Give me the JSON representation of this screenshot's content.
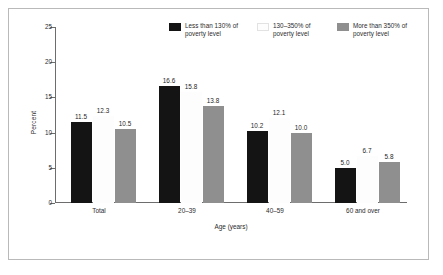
{
  "figure": {
    "background": "#ffffff",
    "frame_color": "#b9b9b9"
  },
  "chart_data": {
    "type": "bar",
    "title": "",
    "subtitle": "",
    "xlabel": "Age (years)",
    "ylabel": "Percent",
    "categories": [
      "Total",
      "20–39",
      "40–59",
      "60 and over"
    ],
    "series": [
      {
        "name": "Less than 130% of poverty level",
        "color": "#141414",
        "values": [
          11.5,
          16.6,
          10.2,
          5.0
        ],
        "labels": [
          "11.5",
          "16.6",
          "10.2",
          "5.0"
        ]
      },
      {
        "name": "130–350% of poverty level",
        "color": "#ffffff",
        "values": [
          12.3,
          15.8,
          12.1,
          6.7
        ],
        "labels": [
          "12.3",
          "15.8",
          "12.1",
          "6.7"
        ]
      },
      {
        "name": "More than 350% of poverty level",
        "color": "#8f8f8f",
        "values": [
          10.5,
          13.8,
          10.0,
          5.8
        ],
        "labels": [
          "10.5",
          "13.8",
          "10.0",
          "5.8"
        ]
      }
    ],
    "ylim": [
      0,
      25
    ],
    "yticks": [
      0,
      5,
      10,
      15,
      20,
      25
    ],
    "ytick_labels": [
      "0",
      "5",
      "10",
      "15",
      "20",
      "25"
    ],
    "grid": false,
    "legend_position": "top-center"
  },
  "legend": {
    "items": [
      {
        "label_line1": "Less than 130% of",
        "label_line2": "poverty level",
        "swatch": "black-swatch-icon"
      },
      {
        "label_line1": "130–350% of",
        "label_line2": "poverty level",
        "swatch": "white-swatch-icon"
      },
      {
        "label_line1": "More than 350% of",
        "label_line2": "poverty level",
        "swatch": "gray-swatch-icon"
      }
    ]
  }
}
